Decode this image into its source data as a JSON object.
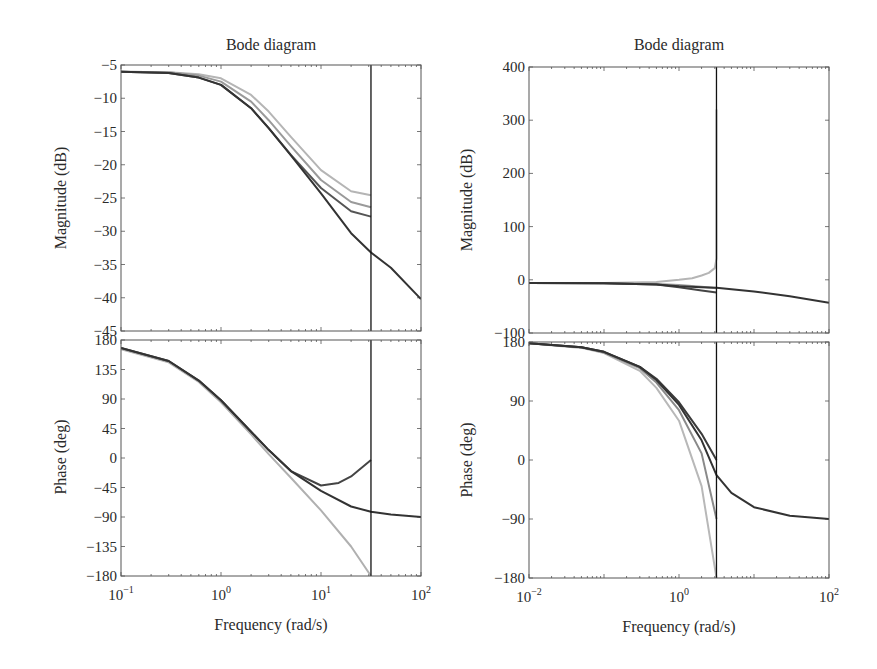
{
  "chart_data": [
    {
      "id": "left",
      "type": "line",
      "title": "Bode diagram",
      "xlabel": "Frequency (rad/s)",
      "xscale": "log",
      "xlim": [
        0.1,
        100
      ],
      "xticks": [
        {
          "v": 0.1,
          "base": "10",
          "exp": "−1"
        },
        {
          "v": 1,
          "base": "10",
          "exp": "0"
        },
        {
          "v": 10,
          "base": "10",
          "exp": "1"
        },
        {
          "v": 100,
          "base": "10",
          "exp": "2"
        }
      ],
      "vertical_marker_x": 31.6,
      "magnitude": {
        "ylabel": "Magnitude (dB)",
        "ylim": [
          -45,
          -5
        ],
        "yticks": [
          -5,
          -10,
          -15,
          -20,
          -25,
          -30,
          -35,
          -40,
          -45
        ],
        "series": [
          {
            "name": "nominal",
            "color": "#333333",
            "x": [
              0.1,
              0.3,
              0.6,
              1,
              2,
              3,
              5,
              10,
              20,
              31.6,
              50,
              100
            ],
            "y": [
              -6.0,
              -6.2,
              -6.9,
              -8.0,
              -11.5,
              -14.5,
              -18.6,
              -24.3,
              -30.3,
              -33.2,
              -35.5,
              -40.2
            ]
          },
          {
            "name": "case-1",
            "color": "#555555",
            "x": [
              0.1,
              0.3,
              0.6,
              1,
              2,
              3,
              5,
              10,
              20,
              31.6
            ],
            "y": [
              -6.0,
              -6.2,
              -6.9,
              -8.0,
              -11.5,
              -14.5,
              -18.5,
              -23.5,
              -27.0,
              -27.8
            ]
          },
          {
            "name": "case-2",
            "color": "#9a9a9a",
            "x": [
              0.1,
              0.3,
              0.6,
              1,
              2,
              3,
              5,
              10,
              20,
              31.6
            ],
            "y": [
              -6.0,
              -6.1,
              -6.6,
              -7.5,
              -10.5,
              -13.3,
              -17.2,
              -22.3,
              -25.6,
              -26.4
            ]
          },
          {
            "name": "case-3",
            "color": "#b5b5b5",
            "x": [
              0.1,
              0.3,
              0.6,
              1,
              2,
              3,
              5,
              10,
              20,
              31.6
            ],
            "y": [
              -6.0,
              -6.1,
              -6.4,
              -7.0,
              -9.5,
              -12.0,
              -15.8,
              -20.8,
              -24.0,
              -24.6
            ]
          }
        ]
      },
      "phase": {
        "ylabel": "Phase (deg)",
        "ylim": [
          -180,
          180
        ],
        "yticks": [
          180,
          135,
          90,
          45,
          0,
          -45,
          -90,
          -135,
          -180
        ],
        "series": [
          {
            "name": "nominal",
            "color": "#333333",
            "x": [
              0.1,
              0.3,
              0.6,
              1,
              2,
              3,
              5,
              10,
              20,
              31.6,
              50,
              100
            ],
            "y": [
              168,
              148,
              118,
              88,
              40,
              12,
              -20,
              -50,
              -74,
              -82,
              -86,
              -90
            ]
          },
          {
            "name": "case-1",
            "color": "#444444",
            "x": [
              0.1,
              0.3,
              0.6,
              1,
              2,
              3,
              5,
              10,
              15,
              20,
              31.6
            ],
            "y": [
              168,
              148,
              118,
              88,
              40,
              12,
              -20,
              -42,
              -38,
              -28,
              -3
            ]
          },
          {
            "name": "case-2",
            "color": "#b0b0b0",
            "x": [
              0.1,
              0.3,
              0.6,
              1,
              2,
              3,
              5,
              10,
              20,
              31.6
            ],
            "y": [
              166,
              146,
              116,
              85,
              36,
              6,
              -30,
              -80,
              -135,
              -180
            ]
          }
        ]
      }
    },
    {
      "id": "right",
      "type": "line",
      "title": "Bode diagram",
      "xlabel": "Frequency (rad/s)",
      "xscale": "log",
      "xlim": [
        0.01,
        100
      ],
      "xticks": [
        {
          "v": 0.01,
          "base": "10",
          "exp": "−2"
        },
        {
          "v": 1,
          "base": "10",
          "exp": "0"
        },
        {
          "v": 100,
          "base": "10",
          "exp": "2"
        }
      ],
      "vertical_marker_x": 3.16,
      "magnitude": {
        "ylabel": "Magnitude (dB)",
        "ylim": [
          -100,
          400
        ],
        "yticks": [
          400,
          300,
          200,
          100,
          0,
          -100
        ],
        "series": [
          {
            "name": "nominal",
            "color": "#333333",
            "x": [
              0.01,
              0.1,
              0.5,
              1,
              2,
              3.16,
              10,
              30,
              100
            ],
            "y": [
              -6,
              -6.5,
              -9,
              -12,
              -14,
              -15,
              -22,
              -31,
              -43
            ]
          },
          {
            "name": "case-1",
            "color": "#444444",
            "x": [
              0.01,
              0.1,
              0.5,
              1,
              2,
              3.16
            ],
            "y": [
              -6,
              -6.5,
              -9,
              -14,
              -20,
              -24
            ]
          },
          {
            "name": "case-2",
            "color": "#9a9a9a",
            "x": [
              0.01,
              0.1,
              0.5,
              1,
              2,
              3.16
            ],
            "y": [
              -6,
              -6.3,
              -8,
              -10,
              -13,
              -16
            ]
          },
          {
            "name": "case-3",
            "color": "#b5b5b5",
            "x": [
              0.01,
              0.1,
              0.5,
              1,
              1.5,
              2,
              2.5,
              3.0,
              3.16,
              3.16
            ],
            "y": [
              -6,
              -5.8,
              -4,
              0,
              3,
              8,
              13,
              22,
              40,
              320
            ]
          }
        ]
      },
      "phase": {
        "ylabel": "Phase (deg)",
        "ylim": [
          -180,
          180
        ],
        "yticks": [
          180,
          90,
          0,
          -90,
          -180
        ],
        "series": [
          {
            "name": "nominal",
            "color": "#333333",
            "x": [
              0.01,
              0.05,
              0.1,
              0.3,
              0.5,
              1,
              2,
              3.16,
              5,
              10,
              30,
              100
            ],
            "y": [
              178,
              172,
              165,
              142,
              122,
              84,
              30,
              -23,
              -50,
              -72,
              -85,
              -90
            ]
          },
          {
            "name": "case-1",
            "color": "#3a3a3a",
            "x": [
              0.01,
              0.05,
              0.1,
              0.3,
              0.5,
              1,
              2,
              3.16
            ],
            "y": [
              178,
              172,
              165,
              142,
              124,
              88,
              40,
              0
            ]
          },
          {
            "name": "case-2",
            "color": "#8a8a8a",
            "x": [
              0.01,
              0.05,
              0.1,
              0.3,
              0.5,
              1,
              2,
              3.16
            ],
            "y": [
              178,
              172,
              164,
              140,
              118,
              76,
              10,
              -90
            ]
          },
          {
            "name": "case-3",
            "color": "#b8b8b8",
            "x": [
              0.01,
              0.05,
              0.1,
              0.3,
              0.5,
              1,
              2,
              3.16
            ],
            "y": [
              178,
              171,
              163,
              136,
              110,
              60,
              -40,
              -180
            ]
          }
        ]
      }
    }
  ],
  "titles": {
    "left": "Bode diagram",
    "right": "Bode diagram"
  },
  "labels": {
    "left_mag_ylabel": "Magnitude (dB)",
    "left_phase_ylabel": "Phase (deg)",
    "left_xlabel": "Frequency (rad/s)",
    "right_mag_ylabel": "Magnitude (dB)",
    "right_phase_ylabel": "Phase (deg)",
    "right_xlabel": "Frequency (rad/s)"
  }
}
